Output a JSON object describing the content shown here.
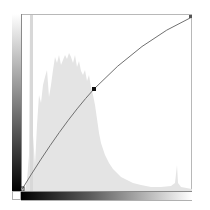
{
  "widget": {
    "type": "curves-adjustment",
    "channel": "RGB"
  },
  "curve": {
    "line_color": "#6e6e6e",
    "point_color": "#111111",
    "points": [
      {
        "input": 0,
        "output": 0
      },
      {
        "input": 95,
        "output": 132
      },
      {
        "input": 255,
        "output": 255
      }
    ]
  },
  "histogram": {
    "fill_color": "#e6e6e6"
  },
  "input_gradient": {
    "from": "#000000",
    "to": "#ffffff"
  },
  "output_gradient": {
    "from": "#000000",
    "to": "#ffffff"
  }
}
